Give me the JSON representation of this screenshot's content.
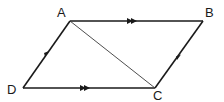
{
  "diagram": {
    "vertices": [
      {
        "id": "A",
        "label": "A"
      },
      {
        "id": "B",
        "label": "B"
      },
      {
        "id": "C",
        "label": "C"
      },
      {
        "id": "D",
        "label": "D"
      }
    ],
    "edges": [
      {
        "from": "A",
        "to": "B",
        "marker": "double-arrow"
      },
      {
        "from": "D",
        "to": "C",
        "marker": "double-arrow"
      },
      {
        "from": "D",
        "to": "A",
        "marker": "single-arrow"
      },
      {
        "from": "C",
        "to": "B",
        "marker": "single-arrow"
      },
      {
        "from": "A",
        "to": "C",
        "marker": "none",
        "style": "thin"
      }
    ],
    "colors": {
      "line": "#1a1a1a",
      "background": "#ffffff"
    }
  }
}
